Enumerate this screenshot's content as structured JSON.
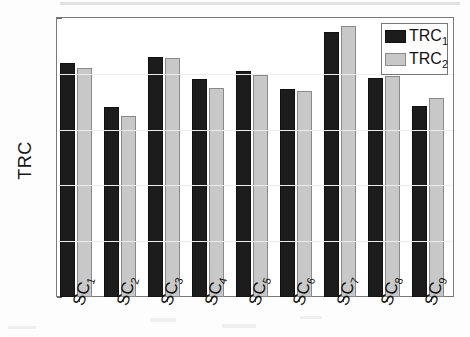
{
  "chart_data": {
    "type": "bar",
    "title": "",
    "xlabel": "",
    "ylabel": "TRC",
    "categories": [
      "SC1",
      "SC2",
      "SC3",
      "SC4",
      "SC5",
      "SC6",
      "SC7",
      "SC8",
      "SC9"
    ],
    "category_labels": [
      {
        "base": "SC",
        "sub": "1"
      },
      {
        "base": "SC",
        "sub": "2"
      },
      {
        "base": "SC",
        "sub": "3"
      },
      {
        "base": "SC",
        "sub": "4"
      },
      {
        "base": "SC",
        "sub": "5"
      },
      {
        "base": "SC",
        "sub": "6"
      },
      {
        "base": "SC",
        "sub": "7"
      },
      {
        "base": "SC",
        "sub": "8"
      },
      {
        "base": "SC",
        "sub": "9"
      }
    ],
    "series": [
      {
        "name": "TRC1",
        "legend_base": "TRC",
        "legend_sub": "1",
        "color": "#1c1c1c",
        "values": [
          0.84,
          0.68,
          0.86,
          0.78,
          0.81,
          0.745,
          0.95,
          0.785,
          0.685
        ]
      },
      {
        "name": "TRC2",
        "legend_base": "TRC",
        "legend_sub": "2",
        "color": "#c8c8c8",
        "values": [
          0.82,
          0.65,
          0.855,
          0.75,
          0.795,
          0.738,
          0.97,
          0.793,
          0.715
        ]
      }
    ],
    "ylim": [
      0,
      1
    ],
    "yticks": [
      0,
      0.2,
      0.4,
      0.6,
      0.8,
      1
    ],
    "ytick_labels": [
      "0",
      "0.2",
      "0.4",
      "0.6",
      "0.8",
      "1"
    ],
    "grid": false,
    "legend_position": "top-right"
  },
  "figure": {
    "background_color": "#ffffff",
    "axis_color": "#7a7a7a"
  }
}
